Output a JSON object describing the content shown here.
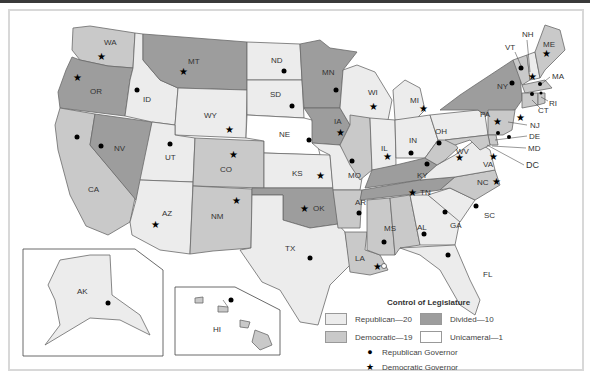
{
  "legend": {
    "title": "Control of Legislature",
    "items": [
      {
        "label": "Republican—20",
        "color": "#ececec"
      },
      {
        "label": "Divided—10",
        "color": "#9d9d9d"
      },
      {
        "label": "Democratic—19",
        "color": "#c9c9c9"
      },
      {
        "label": "Unicameral—1",
        "color": "#ffffff"
      }
    ],
    "governors": [
      {
        "symbol": "●",
        "label": "Republican Governor",
        "icon": "dot-icon"
      },
      {
        "symbol": "★",
        "label": "Democratic Governor",
        "icon": "star-icon"
      }
    ]
  },
  "colors": {
    "republican": "#ececec",
    "democratic": "#c9c9c9",
    "divided": "#9d9d9d",
    "unicameral": "#ffffff",
    "border": "#6a6a6a"
  },
  "states": {
    "WA": {
      "label": "WA",
      "legislature": "democratic",
      "governor": "democratic"
    },
    "OR": {
      "label": "OR",
      "legislature": "divided",
      "governor": "democratic"
    },
    "CA": {
      "label": "CA",
      "legislature": "democratic",
      "governor": "republican"
    },
    "NV": {
      "label": "NV",
      "legislature": "divided",
      "governor": "republican"
    },
    "ID": {
      "label": "ID",
      "legislature": "republican",
      "governor": "republican"
    },
    "MT": {
      "label": "MT",
      "legislature": "divided",
      "governor": "democratic"
    },
    "WY": {
      "label": "WY",
      "legislature": "republican",
      "governor": "democratic"
    },
    "UT": {
      "label": "UT",
      "legislature": "republican",
      "governor": "republican"
    },
    "AZ": {
      "label": "AZ",
      "legislature": "republican",
      "governor": "democratic"
    },
    "CO": {
      "label": "CO",
      "legislature": "democratic",
      "governor": "democratic"
    },
    "NM": {
      "label": "NM",
      "legislature": "democratic",
      "governor": "democratic"
    },
    "ND": {
      "label": "ND",
      "legislature": "republican",
      "governor": "republican"
    },
    "SD": {
      "label": "SD",
      "legislature": "republican",
      "governor": "republican"
    },
    "NE": {
      "label": "NE",
      "legislature": "unicameral",
      "governor": "republican"
    },
    "KS": {
      "label": "KS",
      "legislature": "republican",
      "governor": "democratic"
    },
    "OK": {
      "label": "OK",
      "legislature": "divided",
      "governor": "democratic"
    },
    "TX": {
      "label": "TX",
      "legislature": "republican",
      "governor": "republican"
    },
    "MN": {
      "label": "MN",
      "legislature": "divided",
      "governor": "republican"
    },
    "IA": {
      "label": "IA",
      "legislature": "divided",
      "governor": "democratic"
    },
    "MO": {
      "label": "MO",
      "legislature": "republican",
      "governor": "republican"
    },
    "AR": {
      "label": "AR",
      "legislature": "democratic",
      "governor": "republican"
    },
    "LA": {
      "label": "LA",
      "legislature": "democratic",
      "governor": "democratic"
    },
    "WI": {
      "label": "WI",
      "legislature": "republican",
      "governor": "democratic"
    },
    "IL": {
      "label": "IL",
      "legislature": "democratic",
      "governor": "democratic"
    },
    "MI": {
      "label": "MI",
      "legislature": "republican",
      "governor": "democratic"
    },
    "IN": {
      "label": "IN",
      "legislature": "republican",
      "governor": "republican"
    },
    "OH": {
      "label": "OH",
      "legislature": "republican",
      "governor": "republican"
    },
    "KY": {
      "label": "KY",
      "legislature": "divided",
      "governor": "republican"
    },
    "TN": {
      "label": "TN",
      "legislature": "divided",
      "governor": "democratic"
    },
    "MS": {
      "label": "MS",
      "legislature": "democratic",
      "governor": "republican"
    },
    "AL": {
      "label": "AL",
      "legislature": "democratic",
      "governor": "republican"
    },
    "GA": {
      "label": "GA",
      "legislature": "republican",
      "governor": "republican"
    },
    "FL": {
      "label": "FL",
      "legislature": "republican",
      "governor": "republican"
    },
    "SC": {
      "label": "SC",
      "legislature": "republican",
      "governor": "republican"
    },
    "NC": {
      "label": "NC",
      "legislature": "democratic",
      "governor": "democratic"
    },
    "VA": {
      "label": "VA",
      "legislature": "republican",
      "governor": "democratic"
    },
    "WV": {
      "label": "WV",
      "legislature": "democratic",
      "governor": "democratic"
    },
    "PA": {
      "label": "PA",
      "legislature": "republican",
      "governor": "democratic"
    },
    "NY": {
      "label": "NY",
      "legislature": "divided",
      "governor": "republican"
    },
    "VT": {
      "label": "VT",
      "legislature": "democratic",
      "governor": "republican"
    },
    "NH": {
      "label": "NH",
      "legislature": "republican",
      "governor": "democratic"
    },
    "ME": {
      "label": "ME",
      "legislature": "democratic",
      "governor": "democratic"
    },
    "MA": {
      "label": "MA",
      "legislature": "democratic",
      "governor": "republican"
    },
    "RI": {
      "label": "RI",
      "legislature": "democratic",
      "governor": "republican"
    },
    "CT": {
      "label": "CT",
      "legislature": "democratic",
      "governor": "republican"
    },
    "NJ": {
      "label": "NJ",
      "legislature": "democratic",
      "governor": "democratic"
    },
    "DE": {
      "label": "DE",
      "legislature": "democratic",
      "governor": "democratic"
    },
    "MD": {
      "label": "MD",
      "legislature": "democratic",
      "governor": "republican"
    },
    "DC": {
      "label": "DC"
    },
    "AK": {
      "label": "AK",
      "legislature": "republican",
      "governor": "republican"
    },
    "HI": {
      "label": "HI",
      "legislature": "democratic",
      "governor": "republican"
    }
  }
}
